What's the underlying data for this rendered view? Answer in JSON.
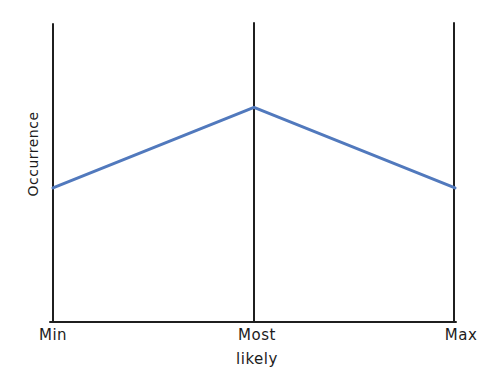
{
  "chart": {
    "ylabel": "Occurrence",
    "x_ticks": {
      "min": "Min",
      "most_line1": "Most",
      "most_line2": "likely",
      "max": "Max"
    }
  },
  "chart_data": {
    "type": "line",
    "title": "",
    "xlabel": "",
    "ylabel": "Occurrence",
    "categories": [
      "Min",
      "Most likely",
      "Max"
    ],
    "values": [
      0.45,
      0.72,
      0.45
    ],
    "ylim": [
      0,
      1
    ],
    "grid": false,
    "legend": false,
    "colors": {
      "line": "#5179bd",
      "axis": "#1f1f1f",
      "text": "#1c1c1c",
      "background": "#ffffff"
    }
  }
}
